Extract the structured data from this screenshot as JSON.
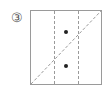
{
  "figure": {
    "label": "③",
    "square": {
      "x": 30,
      "y": 10,
      "width": 72,
      "height": 75,
      "stroke": "#9a9a9a"
    },
    "dividers": [
      {
        "x": 54,
        "style": "dashed"
      },
      {
        "x": 78,
        "style": "dashed"
      }
    ],
    "diagonal": {
      "from": [
        31,
        84
      ],
      "to": [
        101,
        11
      ],
      "style": "dashed"
    },
    "dots": [
      {
        "cx": 66,
        "cy": 32
      },
      {
        "cx": 66,
        "cy": 66
      }
    ],
    "colors": {
      "stroke": "#9a9a9a",
      "dot": "#222222"
    }
  }
}
